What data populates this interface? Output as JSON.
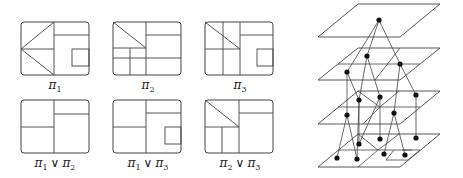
{
  "colors": {
    "stroke": "#444444",
    "dot": "#111111",
    "background": "#ffffff"
  },
  "partitions": [
    {
      "id": "pi1",
      "label": "π",
      "sub": "1",
      "join": null,
      "box": [
        21,
        22,
        68,
        53
      ],
      "label_pos": [
        55,
        92
      ],
      "lines": [
        [
          54,
          22,
          54,
          75
        ],
        [
          54,
          35,
          89,
          35
        ],
        [
          21,
          49,
          54,
          49
        ],
        [
          21,
          49,
          54,
          22
        ],
        [
          21,
          49,
          54,
          75
        ]
      ],
      "rects": [
        [
          72,
          49,
          17,
          17
        ]
      ]
    },
    {
      "id": "pi2",
      "label": "π",
      "sub": "2",
      "join": null,
      "box": [
        113,
        22,
        68,
        53
      ],
      "label_pos": [
        148,
        92
      ],
      "lines": [
        [
          146,
          22,
          146,
          75
        ],
        [
          146,
          35,
          181,
          35
        ],
        [
          113,
          48,
          146,
          48
        ],
        [
          113,
          58,
          181,
          58
        ],
        [
          130,
          48,
          130,
          75
        ],
        [
          113,
          22,
          146,
          48
        ]
      ],
      "rects": []
    },
    {
      "id": "pi3",
      "label": "π",
      "sub": "3",
      "join": null,
      "box": [
        205,
        22,
        68,
        53
      ],
      "label_pos": [
        240,
        92
      ],
      "lines": [
        [
          223,
          22,
          223,
          75
        ],
        [
          240,
          22,
          240,
          75
        ],
        [
          240,
          35,
          273,
          35
        ],
        [
          205,
          49,
          240,
          49
        ],
        [
          205,
          22,
          240,
          49
        ]
      ],
      "rects": [
        [
          257,
          49,
          16,
          17
        ]
      ]
    },
    {
      "id": "pi1_join_pi2",
      "label": "π",
      "sub": "1",
      "join": {
        "op": "∨",
        "label": "π",
        "sub": "2"
      },
      "box": [
        21,
        100,
        68,
        53
      ],
      "label_pos": [
        55,
        170
      ],
      "lines": [
        [
          54,
          100,
          54,
          153
        ],
        [
          54,
          114,
          89,
          114
        ],
        [
          21,
          127,
          54,
          127
        ]
      ],
      "rects": []
    },
    {
      "id": "pi1_join_pi3",
      "label": "π",
      "sub": "1",
      "join": {
        "op": "∨",
        "label": "π",
        "sub": "3"
      },
      "box": [
        113,
        100,
        68,
        53
      ],
      "label_pos": [
        148,
        170
      ],
      "lines": [
        [
          146,
          100,
          146,
          153
        ],
        [
          146,
          113,
          181,
          113
        ],
        [
          113,
          127,
          146,
          127
        ]
      ],
      "rects": [
        [
          165,
          127,
          16,
          17
        ]
      ]
    },
    {
      "id": "pi2_join_pi3",
      "label": "π",
      "sub": "2",
      "join": {
        "op": "∨",
        "label": "π",
        "sub": "3"
      },
      "box": [
        205,
        100,
        68,
        53
      ],
      "label_pos": [
        240,
        170
      ],
      "lines": [
        [
          239,
          100,
          239,
          153
        ],
        [
          239,
          113,
          273,
          113
        ],
        [
          205,
          127,
          239,
          127
        ],
        [
          222,
          127,
          222,
          153
        ],
        [
          205,
          100,
          239,
          127
        ]
      ],
      "rects": []
    }
  ],
  "lattice": {
    "planes": [
      {
        "id": "level-top",
        "corners": [
          [
            358,
            4
          ],
          [
            440,
            4
          ],
          [
            400,
            37
          ],
          [
            318,
            37
          ]
        ],
        "lines": []
      },
      {
        "id": "level-2",
        "corners": [
          [
            358,
            48
          ],
          [
            440,
            48
          ],
          [
            400,
            80
          ],
          [
            318,
            80
          ]
        ],
        "lines": [
          [
            338,
            64,
            420,
            64
          ],
          [
            400,
            48,
            375,
            80
          ]
        ]
      },
      {
        "id": "level-3",
        "corners": [
          [
            358,
            91
          ],
          [
            440,
            91
          ],
          [
            400,
            124
          ],
          [
            318,
            124
          ]
        ],
        "lines": [
          [
            338,
            107,
            420,
            107
          ],
          [
            358,
            91,
            380,
            107
          ],
          [
            380,
            107,
            363,
            124
          ],
          [
            399,
            91,
            380,
            107
          ]
        ]
      },
      {
        "id": "level-bottom",
        "corners": [
          [
            358,
            134
          ],
          [
            440,
            134
          ],
          [
            400,
            167
          ],
          [
            318,
            167
          ]
        ],
        "lines": [
          [
            338,
            150,
            420,
            150
          ],
          [
            358,
            134,
            378,
            150
          ],
          [
            378,
            150,
            358,
            167
          ],
          [
            399,
            134,
            378,
            150
          ],
          [
            378,
            150,
            378,
            150
          ],
          [
            402,
            150,
            412,
            150
          ],
          [
            394,
            150,
            386,
            160
          ],
          [
            386,
            160,
            408,
            160
          ],
          [
            420,
            150,
            408,
            160
          ]
        ]
      }
    ],
    "nodes": [
      {
        "id": "top",
        "x": 379,
        "y": 20
      },
      {
        "id": "a",
        "x": 367,
        "y": 56
      },
      {
        "id": "b",
        "x": 347,
        "y": 72
      },
      {
        "id": "c",
        "x": 400,
        "y": 64
      },
      {
        "id": "d",
        "x": 359,
        "y": 100
      },
      {
        "id": "e",
        "x": 380,
        "y": 97
      },
      {
        "id": "f",
        "x": 416,
        "y": 95
      },
      {
        "id": "g",
        "x": 347,
        "y": 115
      },
      {
        "id": "h",
        "x": 394,
        "y": 113
      },
      {
        "id": "i",
        "x": 359,
        "y": 144
      },
      {
        "id": "j",
        "x": 380,
        "y": 139
      },
      {
        "id": "k",
        "x": 416,
        "y": 138
      },
      {
        "id": "l",
        "x": 337,
        "y": 158
      },
      {
        "id": "m",
        "x": 357,
        "y": 159
      },
      {
        "id": "n",
        "x": 384,
        "y": 154
      },
      {
        "id": "o",
        "x": 405,
        "y": 155
      }
    ],
    "edges": [
      [
        "top",
        "a"
      ],
      [
        "top",
        "b"
      ],
      [
        "top",
        "c"
      ],
      [
        "a",
        "d"
      ],
      [
        "a",
        "e"
      ],
      [
        "b",
        "g"
      ],
      [
        "c",
        "f"
      ],
      [
        "c",
        "h"
      ],
      [
        "b",
        "d"
      ],
      [
        "d",
        "i"
      ],
      [
        "e",
        "j"
      ],
      [
        "f",
        "k"
      ],
      [
        "g",
        "l"
      ],
      [
        "g",
        "m"
      ],
      [
        "h",
        "n"
      ],
      [
        "h",
        "o"
      ],
      [
        "d",
        "m"
      ],
      [
        "e",
        "i"
      ]
    ]
  }
}
